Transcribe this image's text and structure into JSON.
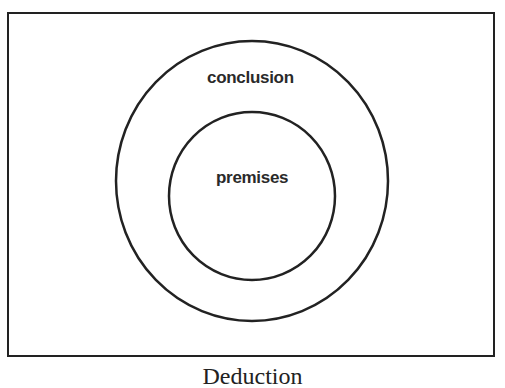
{
  "diagram": {
    "outer_circle": {
      "label": "conclusion"
    },
    "inner_circle": {
      "label": "premises"
    },
    "caption": "Deduction"
  },
  "colors": {
    "stroke": "#222222",
    "background": "#ffffff"
  }
}
